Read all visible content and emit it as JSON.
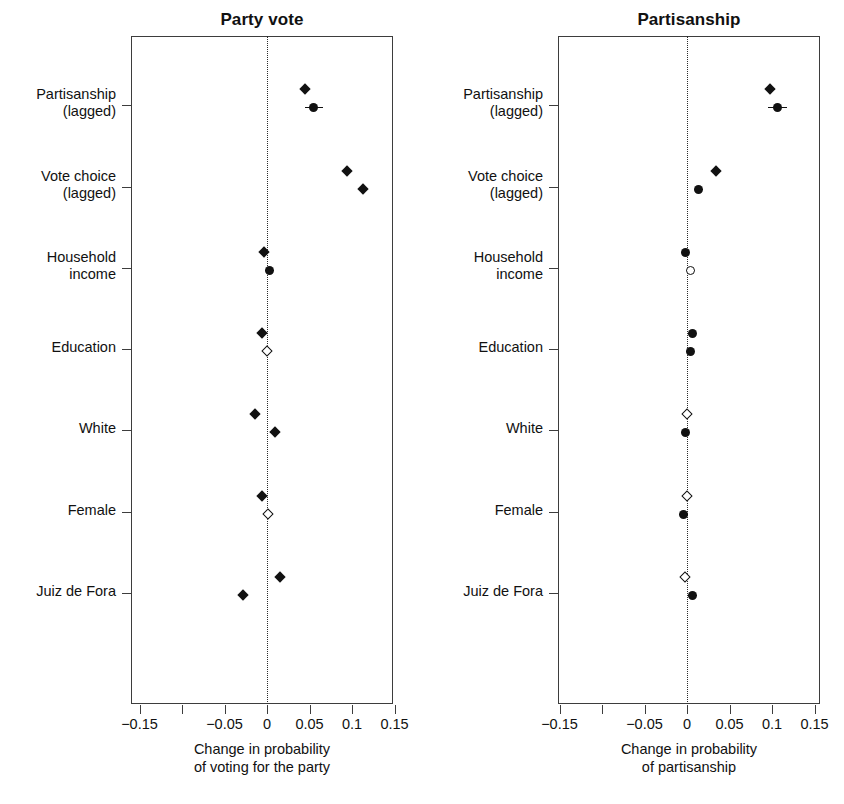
{
  "figure": {
    "background": "#ffffff",
    "foreground": "#111111",
    "panel_count": 2
  },
  "chart_data": [
    {
      "type": "scatter",
      "title": "Party vote",
      "subtitle": "",
      "xlabel": "Change in probability\nof voting for the party",
      "xlabel_line1": "Change in probability",
      "xlabel_line2": "of voting for the party",
      "ylabel": "",
      "xlim": [
        -0.175,
        0.175
      ],
      "xticks": [
        -0.15,
        -0.1,
        -0.05,
        0,
        0.05,
        0.1,
        0.15
      ],
      "xticklabels": [
        "−0.15",
        "",
        "−0.05",
        "0",
        "0.05",
        "0.1",
        "0.15"
      ],
      "grid": false,
      "legend": "none",
      "reference_line": 0,
      "reference_line_style": "dotted",
      "categories": [
        "Partisanship\n(lagged)",
        "Vote choice\n(lagged)",
        "Household\nincome",
        "Education",
        "White",
        "Female",
        "Juiz de Fora"
      ],
      "series": [
        {
          "name": "estimate-upper",
          "marker": "solid-diamond",
          "values": [
            0.045,
            0.094,
            -0.004,
            -0.006,
            -0.014,
            -0.006,
            0.015
          ],
          "ci_low": [
            0.042,
            0.09,
            -0.008,
            -0.01,
            -0.019,
            -0.01,
            0.01
          ],
          "ci_high": [
            0.049,
            0.098,
            0.0,
            -0.002,
            -0.009,
            -0.002,
            0.02
          ]
        },
        {
          "name": "estimate-lower",
          "marker": "solid-circle",
          "values": [
            0.055,
            0.113,
            0.003,
            0.0,
            0.009,
            0.001,
            -0.028
          ],
          "markers": [
            "solid-circle",
            "solid-diamond",
            "solid-circle",
            "open-diamond",
            "solid-diamond",
            "open-diamond",
            "solid-diamond"
          ],
          "ci_low": [
            0.045,
            0.108,
            -0.002,
            -0.004,
            0.004,
            -0.003,
            -0.033
          ],
          "ci_high": [
            0.066,
            0.118,
            0.008,
            0.004,
            0.014,
            0.005,
            -0.023
          ]
        }
      ]
    },
    {
      "type": "scatter",
      "title": "Partisanship",
      "subtitle": "",
      "xlabel": "Change in probability\nof partisanship",
      "xlabel_line1": "Change in probability",
      "xlabel_line2": "of partisanship",
      "ylabel": "",
      "xlim": [
        -0.175,
        0.175
      ],
      "xticks": [
        -0.15,
        -0.1,
        -0.05,
        0,
        0.05,
        0.1,
        0.15
      ],
      "xticklabels": [
        "−0.15",
        "",
        "−0.05",
        "0",
        "0.05",
        "0.1",
        "0.15"
      ],
      "grid": false,
      "legend": "none",
      "reference_line": 0,
      "reference_line_style": "dotted",
      "categories": [
        "Partisanship\n(lagged)",
        "Vote choice\n(lagged)",
        "Household\nincome",
        "Education",
        "White",
        "Female",
        "Juiz de Fora"
      ],
      "series": [
        {
          "name": "estimate-upper",
          "marker": "solid-diamond",
          "values": [
            0.098,
            0.034,
            -0.002,
            0.007,
            0.0,
            0.0,
            -0.002
          ],
          "markers": [
            "solid-diamond",
            "solid-diamond",
            "solid-circle",
            "solid-circle",
            "open-diamond",
            "open-diamond",
            "open-diamond"
          ],
          "ci_low": [
            0.094,
            0.03,
            -0.006,
            0.003,
            -0.004,
            -0.004,
            -0.006
          ],
          "ci_high": [
            0.103,
            0.038,
            0.002,
            0.011,
            0.004,
            0.004,
            0.002
          ]
        },
        {
          "name": "estimate-lower",
          "marker": "solid-circle",
          "values": [
            0.106,
            0.014,
            0.004,
            0.004,
            -0.002,
            -0.004,
            0.007
          ],
          "markers": [
            "solid-circle",
            "solid-circle",
            "open-circle",
            "solid-circle",
            "solid-circle",
            "solid-circle",
            "solid-circle"
          ],
          "ci_low": [
            0.095,
            0.009,
            -0.001,
            0.0,
            -0.006,
            -0.009,
            0.002
          ],
          "ci_high": [
            0.118,
            0.019,
            0.009,
            0.008,
            0.002,
            0.001,
            0.012
          ]
        }
      ]
    }
  ],
  "panels": [
    {
      "id": "party-vote",
      "title": "Party vote",
      "axis_title_line1": "Change in probability",
      "axis_title_line2": "of voting for the party",
      "x_tick_labels": [
        "−0.15",
        "",
        "−0.05",
        "0",
        "0.05",
        "0.1",
        "0.15"
      ],
      "y_tick_labels": [
        [
          "Partisanship",
          "(lagged)"
        ],
        [
          "Vote choice",
          "(lagged)"
        ],
        [
          "Household",
          "income"
        ],
        [
          "Education",
          ""
        ],
        [
          "White",
          ""
        ],
        [
          "Female",
          ""
        ],
        [
          "Juiz de Fora",
          ""
        ]
      ]
    },
    {
      "id": "partisanship",
      "title": "Partisanship",
      "axis_title_line1": "Change in probability",
      "axis_title_line2": "of partisanship",
      "x_tick_labels": [
        "−0.15",
        "",
        "−0.05",
        "0",
        "0.05",
        "0.1",
        "0.15"
      ],
      "y_tick_labels": [
        [
          "Partisanship",
          "(lagged)"
        ],
        [
          "Vote choice",
          "(lagged)"
        ],
        [
          "Household",
          "income"
        ],
        [
          "Education",
          ""
        ],
        [
          "White",
          ""
        ],
        [
          "Female",
          ""
        ],
        [
          "Juiz de Fora",
          ""
        ]
      ]
    }
  ]
}
